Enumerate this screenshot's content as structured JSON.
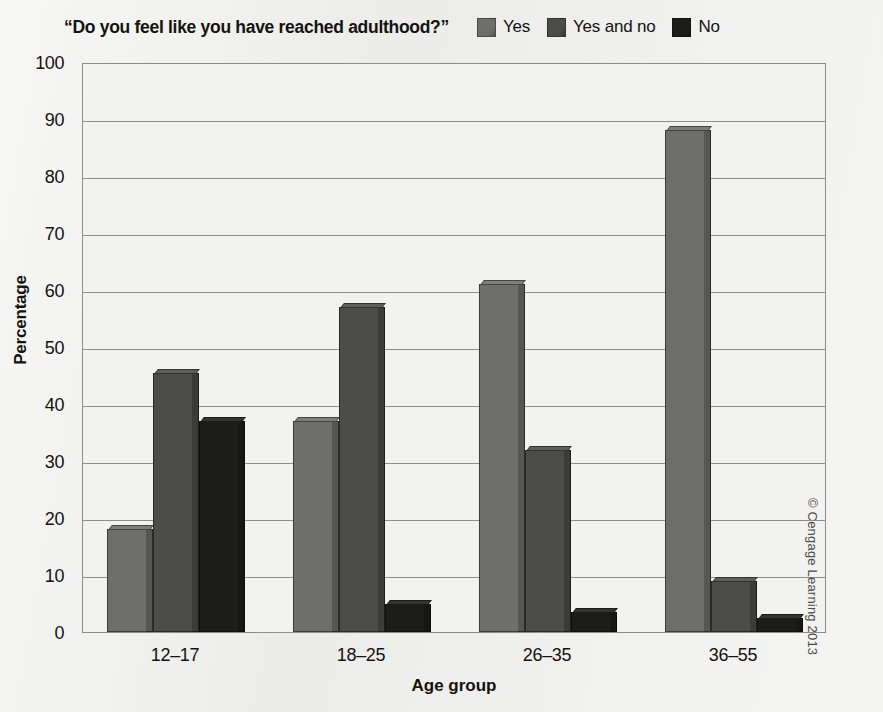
{
  "chart_data": {
    "type": "bar",
    "title": "“Do you feel like you have reached adulthood?”",
    "xlabel": "Age group",
    "ylabel": "Percentage",
    "ylim": [
      0,
      100
    ],
    "ytick_step": 10,
    "yticks": [
      "100",
      "90",
      "80",
      "70",
      "60",
      "50",
      "40",
      "30",
      "20",
      "10",
      "0"
    ],
    "grid": true,
    "legend_position": "top-right",
    "categories": [
      "12–17",
      "18–25",
      "26–35",
      "36–55"
    ],
    "series": [
      {
        "name": "Yes",
        "color": "#6e6e6c",
        "values": [
          18,
          37,
          61,
          88
        ]
      },
      {
        "name": "Yes and no",
        "color": "#4c4c4a",
        "values": [
          45.5,
          57,
          32,
          9
        ]
      },
      {
        "name": "No",
        "color": "#1c1c1a",
        "values": [
          37,
          5,
          3.5,
          2.5
        ]
      }
    ]
  },
  "credit": "© Cengage Learning 2013"
}
